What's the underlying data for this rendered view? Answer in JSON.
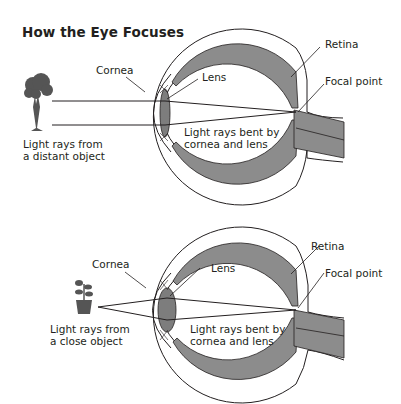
{
  "title": "How the Eye Focuses",
  "colors": {
    "ink": "#231f20",
    "retina_fill": "#8c8c8c",
    "lens_fill": "#7d7d7d",
    "background": "#ffffff"
  },
  "diagrams": [
    {
      "id": "distant",
      "object_icon": "tree-icon",
      "labels": {
        "cornea": "Cornea",
        "lens": "Lens",
        "retina": "Retina",
        "focal_point": "Focal point",
        "object_line1": "Light rays from",
        "object_line2": "a distant object",
        "rays_line1": "Light rays bent by",
        "rays_line2": "cornea and lens"
      }
    },
    {
      "id": "close",
      "object_icon": "potted-plant-icon",
      "labels": {
        "cornea": "Cornea",
        "lens": "Lens",
        "retina": "Retina",
        "focal_point": "Focal point",
        "object_line1": "Light rays from",
        "object_line2": "a close object",
        "rays_line1": "Light rays bent by",
        "rays_line2": "cornea and lens"
      }
    }
  ]
}
